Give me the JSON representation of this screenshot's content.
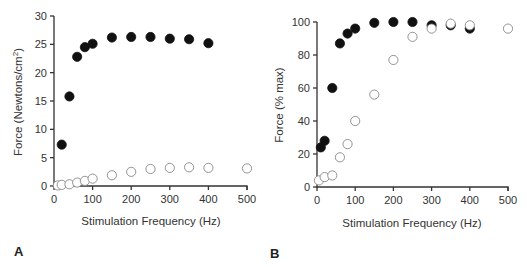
{
  "chart_data": [
    {
      "type": "scatter",
      "panel_label": "A",
      "title": "",
      "xlabel": "Stimulation Frequency (Hz)",
      "ylabel": "Force  (Newtons/cm²)",
      "xlim": [
        0,
        500
      ],
      "ylim": [
        0,
        30
      ],
      "xticks": [
        0,
        100,
        200,
        300,
        400,
        500
      ],
      "yticks": [
        0,
        5,
        10,
        15,
        20,
        25,
        30
      ],
      "grid": false,
      "series": [
        {
          "name": "filled",
          "marker": "filled-circle",
          "color": "#111111",
          "x": [
            20,
            40,
            60,
            80,
            100,
            150,
            200,
            250,
            300,
            350,
            400
          ],
          "y": [
            7.3,
            15.8,
            22.8,
            24.5,
            25.1,
            26.2,
            26.3,
            26.3,
            26.0,
            25.9,
            25.2
          ]
        },
        {
          "name": "open",
          "marker": "open-circle",
          "color": "#888888",
          "x": [
            10,
            20,
            40,
            60,
            80,
            100,
            150,
            200,
            250,
            300,
            350,
            400,
            500
          ],
          "y": [
            0.1,
            0.2,
            0.3,
            0.6,
            0.9,
            1.3,
            1.9,
            2.5,
            3.0,
            3.2,
            3.3,
            3.2,
            3.1
          ]
        }
      ]
    },
    {
      "type": "scatter",
      "panel_label": "B",
      "title": "",
      "xlabel": "Stimulation Frequency (Hz)",
      "ylabel": "Force  (% max)",
      "xlim": [
        0,
        500
      ],
      "ylim": [
        0,
        100
      ],
      "xticks": [
        0,
        100,
        200,
        300,
        400,
        500
      ],
      "yticks": [
        0,
        20,
        40,
        60,
        80,
        100
      ],
      "grid": false,
      "series": [
        {
          "name": "filled",
          "marker": "filled-circle",
          "color": "#111111",
          "x": [
            10,
            20,
            40,
            60,
            80,
            100,
            150,
            200,
            250,
            300,
            350,
            400
          ],
          "y": [
            24,
            28,
            60,
            87,
            93,
            96,
            99.5,
            100,
            100,
            98,
            98,
            96
          ]
        },
        {
          "name": "open",
          "marker": "open-circle",
          "color": "#888888",
          "x": [
            5,
            20,
            40,
            60,
            80,
            100,
            150,
            200,
            250,
            300,
            350,
            400,
            500
          ],
          "y": [
            4,
            6,
            7,
            18,
            26,
            40,
            56,
            77,
            91,
            96,
            99,
            98,
            96
          ]
        }
      ]
    }
  ]
}
